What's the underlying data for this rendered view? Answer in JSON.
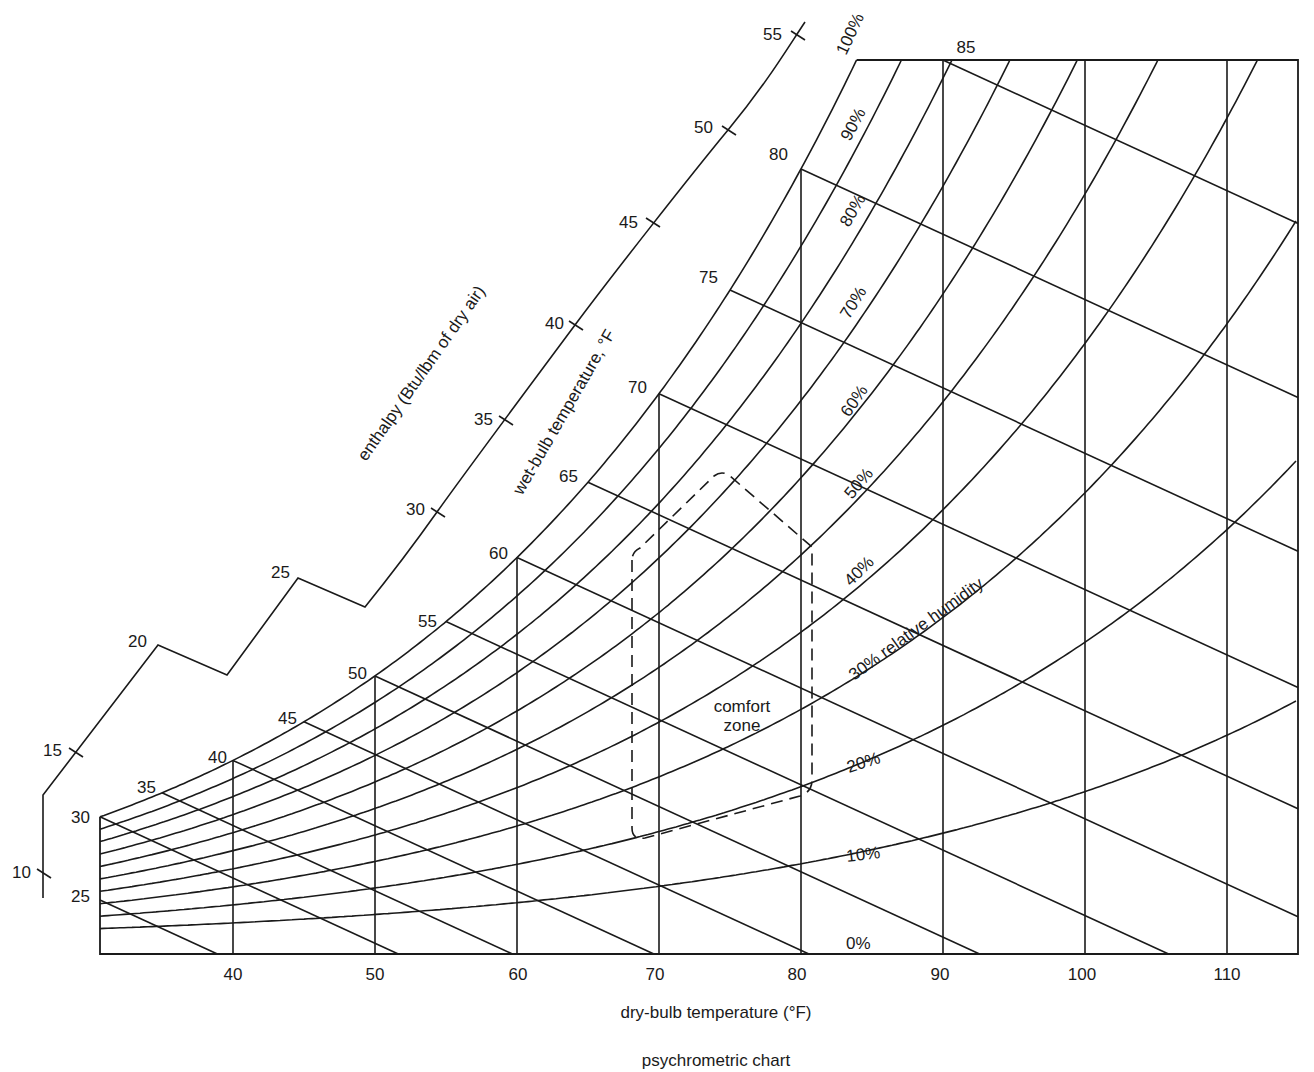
{
  "chart_data": {
    "type": "line",
    "title": "psychrometric chart",
    "xlabel": "dry-bulb temperature  (°F)",
    "xlim": [
      30.6,
      115
    ],
    "x_ticks": [
      40,
      50,
      60,
      70,
      80,
      90,
      100,
      110
    ],
    "grid": true,
    "relative_humidity": {
      "levels_percent": [
        100,
        90,
        80,
        70,
        60,
        50,
        40,
        30,
        20,
        10,
        0
      ],
      "labels": [
        "100%",
        "90%",
        "80%",
        "70%",
        "60%",
        "50%",
        "40%",
        "30% relative humidity",
        "20%",
        "10%",
        "0%"
      ]
    },
    "wet_bulb": {
      "title": "wet-bulb temperature, °F",
      "values": [
        25,
        30,
        35,
        40,
        45,
        50,
        55,
        60,
        65,
        70,
        75,
        80,
        85
      ],
      "labels": [
        "25",
        "30",
        "35",
        "40",
        "45",
        "50",
        "55",
        "60",
        "65",
        "70",
        "75",
        "80",
        "85"
      ]
    },
    "enthalpy": {
      "title": "enthalpy (Btu/lbm of dry air)",
      "values": [
        10,
        15,
        20,
        25,
        30,
        35,
        40,
        45,
        50,
        55
      ],
      "labels": [
        "10",
        "15",
        "20",
        "25",
        "30",
        "35",
        "40",
        "45",
        "50",
        "55"
      ]
    },
    "comfort_zone": {
      "label_line1": "comfort",
      "label_line2": "zone",
      "dry_bulb_range": [
        68,
        81
      ],
      "style": "dashed"
    }
  },
  "labels": {
    "x_ticks": [
      "40",
      "50",
      "60",
      "70",
      "80",
      "90",
      "100",
      "110"
    ],
    "xlabel": "dry-bulb temperature  (°F)",
    "title": "psychrometric chart",
    "wet_bulb_title": "wet-bulb temperature, °F",
    "enthalpy_title": "enthalpy (Btu/lbm of dry air)",
    "comfort_line1": "comfort",
    "comfort_line2": "zone",
    "rh": [
      "100%",
      "90%",
      "80%",
      "70%",
      "60%",
      "50%",
      "40%",
      "30% relative humidity",
      "20%",
      "10%",
      "0%"
    ],
    "wb": [
      "25",
      "30",
      "35",
      "40",
      "45",
      "50",
      "55",
      "60",
      "65",
      "70",
      "75",
      "80",
      "85"
    ],
    "h": [
      "10",
      "15",
      "20",
      "25",
      "30",
      "35",
      "40",
      "45",
      "50",
      "55"
    ]
  }
}
